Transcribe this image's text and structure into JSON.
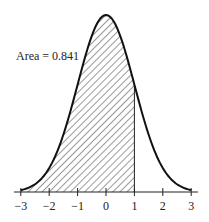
{
  "chart_data": {
    "type": "area",
    "title": "",
    "xlabel": "",
    "ylabel": "",
    "x_ticks": [
      -3,
      -2,
      -1,
      0,
      1,
      2,
      3
    ],
    "x_tick_labels": [
      "−3",
      "−2",
      "−1",
      "0",
      "1",
      "2",
      "3"
    ],
    "xlim": [
      -3.2,
      3.2
    ],
    "grid": false,
    "curve": "normal pdf, mean 0, sd 1",
    "shaded_region": {
      "from": -3,
      "to": 1,
      "pattern": "diagonal hatch"
    },
    "annotation": "Area = 0.841",
    "area_value": 0.841
  },
  "annotation_text": "Area = 0.841",
  "ticks": [
    "−3",
    "−2",
    "−1",
    "0",
    "1",
    "2",
    "3"
  ]
}
